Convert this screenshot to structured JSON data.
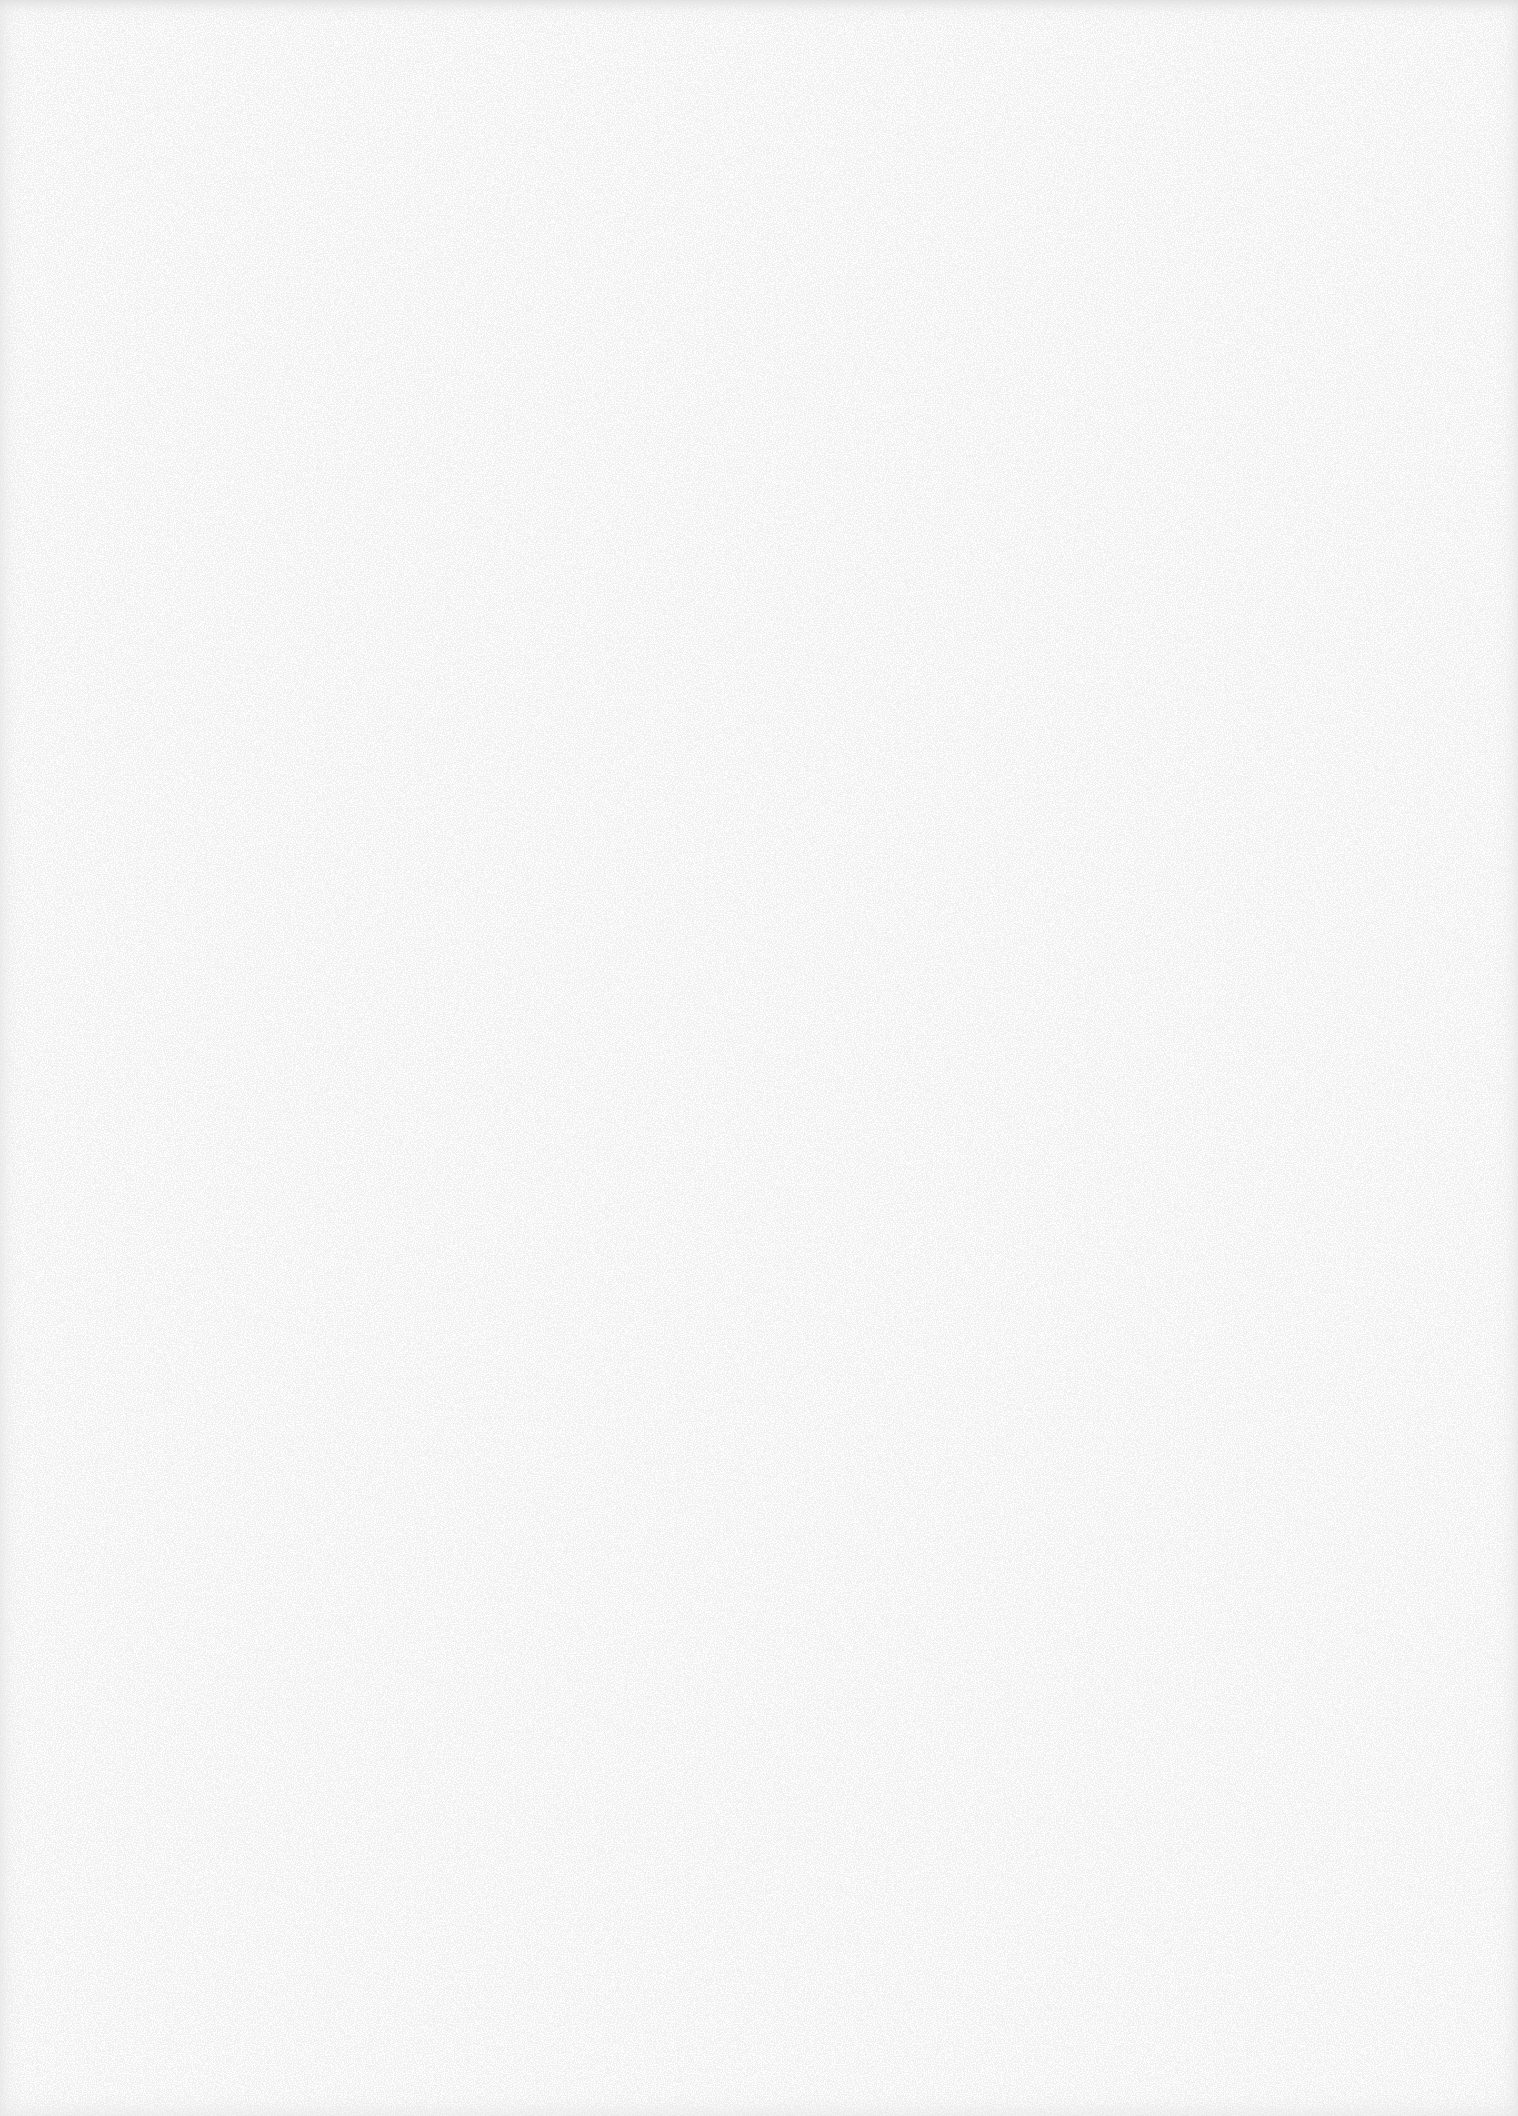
{
  "document": {
    "type": "blank-scanned-page",
    "text": "",
    "paper_color": "#fefefe",
    "speckle_color": "#d4d4d4",
    "edge_shadow_color": "#c8c8c8"
  }
}
